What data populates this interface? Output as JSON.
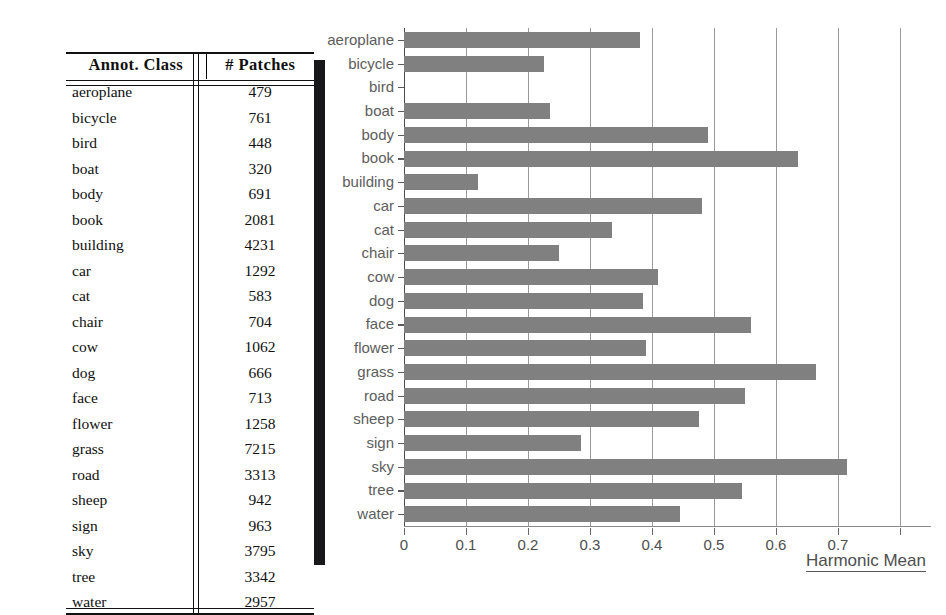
{
  "table": {
    "headers": [
      "Annot. Class",
      "# Patches"
    ],
    "rows": [
      {
        "cls": "aeroplane",
        "patches": "479"
      },
      {
        "cls": "bicycle",
        "patches": "761"
      },
      {
        "cls": "bird",
        "patches": "448"
      },
      {
        "cls": "boat",
        "patches": "320"
      },
      {
        "cls": "body",
        "patches": "691"
      },
      {
        "cls": "book",
        "patches": "2081"
      },
      {
        "cls": "building",
        "patches": "4231"
      },
      {
        "cls": "car",
        "patches": "1292"
      },
      {
        "cls": "cat",
        "patches": "583"
      },
      {
        "cls": "chair",
        "patches": "704"
      },
      {
        "cls": "cow",
        "patches": "1062"
      },
      {
        "cls": "dog",
        "patches": "666"
      },
      {
        "cls": "face",
        "patches": "713"
      },
      {
        "cls": "flower",
        "patches": "1258"
      },
      {
        "cls": "grass",
        "patches": "7215"
      },
      {
        "cls": "road",
        "patches": "3313"
      },
      {
        "cls": "sheep",
        "patches": "942"
      },
      {
        "cls": "sign",
        "patches": "963"
      },
      {
        "cls": "sky",
        "patches": "3795"
      },
      {
        "cls": "tree",
        "patches": "3342"
      },
      {
        "cls": "water",
        "patches": "2957"
      }
    ]
  },
  "chart_data": {
    "type": "bar",
    "orientation": "horizontal",
    "title": "",
    "xlabel": "Harmonic Mean",
    "ylabel": "",
    "xlim": [
      0,
      0.85
    ],
    "xticks": [
      0,
      0.1,
      0.2,
      0.3,
      0.4,
      0.5,
      0.6,
      0.7
    ],
    "xticklabels": [
      "0",
      "0.1",
      "0.2",
      "0.3",
      "0.4",
      "0.5",
      "0.6",
      "0.7"
    ],
    "grid": "vertical",
    "legend": "none",
    "bar_color": "#808080",
    "categories": [
      "aeroplane",
      "bicycle",
      "bird",
      "boat",
      "body",
      "book",
      "building",
      "car",
      "cat",
      "chair",
      "cow",
      "dog",
      "face",
      "flower",
      "grass",
      "road",
      "sheep",
      "sign",
      "sky",
      "tree",
      "water"
    ],
    "values": [
      0.38,
      0.225,
      0.0,
      0.235,
      0.49,
      0.635,
      0.12,
      0.48,
      0.335,
      0.25,
      0.41,
      0.385,
      0.56,
      0.39,
      0.665,
      0.55,
      0.475,
      0.285,
      0.715,
      0.545,
      0.445
    ]
  }
}
